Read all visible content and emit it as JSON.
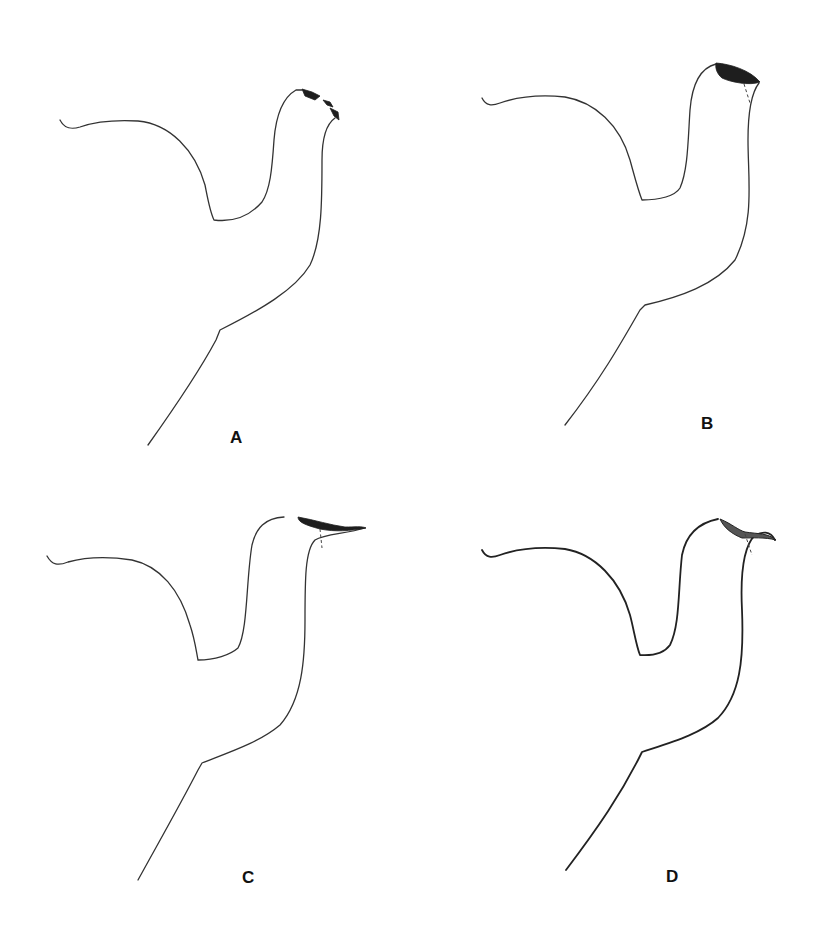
{
  "figure": {
    "panels": [
      {
        "id": "A",
        "label": "A",
        "tip": "tip with jagged black fragments"
      },
      {
        "id": "B",
        "label": "B",
        "tip": "tip with dark oval cap and dashed line"
      },
      {
        "id": "C",
        "label": "C",
        "tip": "elongated tip with dark upper band and dashed line"
      },
      {
        "id": "D",
        "label": "D",
        "tip": "hooked tip with shaded upper band and dashed line"
      }
    ],
    "colors": {
      "line": "#333333",
      "shade": "#1e1e1e",
      "background": "#ffffff"
    }
  }
}
